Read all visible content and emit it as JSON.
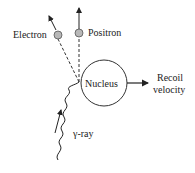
{
  "diagram": {
    "labels": {
      "electron": "Electron",
      "positron": "Positron",
      "nucleus": "Nucleus",
      "recoil_line1": "Recoil",
      "recoil_line2": "velocity",
      "gamma": "γ-ray"
    },
    "colors": {
      "line": "#222222",
      "particle_fill": "#b8b8b8",
      "background": "#ffffff"
    }
  }
}
